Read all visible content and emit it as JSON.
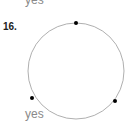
{
  "previous_answer": "yes",
  "problem": {
    "number": "16.",
    "answer": "yes",
    "circle": {
      "cx": 76,
      "cy": 71,
      "r": 49,
      "stroke": "#9a9a9a"
    },
    "points": [
      {
        "cx": 76,
        "cy": 23
      },
      {
        "cx": 115,
        "cy": 101
      },
      {
        "cx": 32,
        "cy": 98
      }
    ]
  }
}
